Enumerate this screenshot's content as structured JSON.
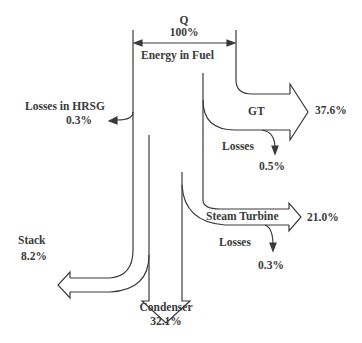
{
  "diagram": {
    "type": "sankey",
    "source": {
      "symbol": "Q",
      "value": "100%",
      "label": "Energy in Fuel"
    },
    "flows": [
      {
        "name": "GT",
        "value": "37.6%"
      },
      {
        "name": "Losses",
        "value": "0.5%"
      },
      {
        "name": "Steam Turbine",
        "value": "21.0%"
      },
      {
        "name": "Losses",
        "value": "0.3%"
      },
      {
        "name": "Losses in HRSG",
        "value": "0.3%"
      },
      {
        "name": "Stack",
        "value": "8.2%"
      },
      {
        "name": "Condenser",
        "value": "32.1%"
      }
    ],
    "line_color": "#3a3a3a"
  },
  "labels": {
    "q": "Q",
    "q_pct": "100%",
    "energy": "Energy in Fuel",
    "hrsg": "Losses in HRSG",
    "hrsg_pct": "0.3%",
    "gt": "GT",
    "gt_pct": "37.6%",
    "gt_losses": "Losses",
    "gt_losses_pct": "0.5%",
    "st": "Steam Turbine",
    "st_pct": "21.0%",
    "st_losses": "Losses",
    "st_losses_pct": "0.3%",
    "stack": "Stack",
    "stack_pct": "8.2%",
    "condenser": "Condenser",
    "condenser_pct": "32.1%"
  }
}
